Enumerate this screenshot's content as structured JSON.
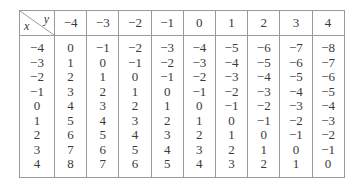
{
  "table": {
    "corner": {
      "row_var": "x",
      "col_var": "y"
    },
    "columns": [
      "−4",
      "−3",
      "−2",
      "−1",
      "0",
      "1",
      "2",
      "3",
      "4"
    ],
    "rows": [
      {
        "x": "−4",
        "cells": [
          "0",
          "−1",
          "−2",
          "−3",
          "−4",
          "−5",
          "−6",
          "−7",
          "−8"
        ]
      },
      {
        "x": "−3",
        "cells": [
          "1",
          "0",
          "−1",
          "−2",
          "−3",
          "−4",
          "−5",
          "−6",
          "−7"
        ]
      },
      {
        "x": "−2",
        "cells": [
          "2",
          "1",
          "0",
          "−1",
          "−2",
          "−3",
          "−4",
          "−5",
          "−6"
        ]
      },
      {
        "x": "−1",
        "cells": [
          "3",
          "2",
          "1",
          "0",
          "−1",
          "−2",
          "−3",
          "−4",
          "−5"
        ]
      },
      {
        "x": "0",
        "cells": [
          "4",
          "3",
          "2",
          "1",
          "0",
          "−1",
          "−2",
          "−3",
          "−4"
        ]
      },
      {
        "x": "1",
        "cells": [
          "5",
          "4",
          "3",
          "2",
          "1",
          "0",
          "−1",
          "−2",
          "−3"
        ]
      },
      {
        "x": "2",
        "cells": [
          "6",
          "5",
          "4",
          "3",
          "2",
          "1",
          "0",
          "−1",
          "−2"
        ]
      },
      {
        "x": "3",
        "cells": [
          "7",
          "6",
          "5",
          "4",
          "3",
          "2",
          "1",
          "0",
          "−1"
        ]
      },
      {
        "x": "4",
        "cells": [
          "8",
          "7",
          "6",
          "5",
          "4",
          "3",
          "2",
          "1",
          "0"
        ]
      }
    ]
  }
}
